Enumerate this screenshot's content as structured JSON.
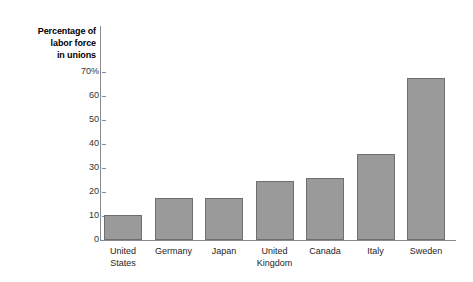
{
  "chart_data": {
    "type": "bar",
    "title": "",
    "subtitle": "",
    "xlabel": "",
    "ylabel": "Percentage of labor force in unions",
    "ylabel_lines": [
      "Percentage of",
      "labor force",
      "in unions"
    ],
    "categories": [
      "United States",
      "Germany",
      "Japan",
      "United Kingdom",
      "Canada",
      "Italy",
      "Sweden"
    ],
    "category_lines": [
      [
        "United",
        "States"
      ],
      [
        "Germany"
      ],
      [
        "Japan"
      ],
      [
        "United",
        "Kingdom"
      ],
      [
        "Canada"
      ],
      [
        "Italy"
      ],
      [
        "Sweden"
      ]
    ],
    "values": [
      10.5,
      17.5,
      17.5,
      24.5,
      26,
      36,
      67.5
    ],
    "ylim": [
      0,
      72
    ],
    "yticks": [
      0,
      10,
      20,
      30,
      40,
      50,
      60,
      70
    ],
    "ytick_labels": [
      "0",
      "10",
      "20",
      "30",
      "40",
      "50",
      "60",
      "70%"
    ],
    "grid": false,
    "legend": false,
    "legend_position": "none",
    "colors": {
      "bar_fill": "#9a9a9a",
      "bar_stroke": "#6f6f6f",
      "axis": "#8a8a8a",
      "text": "#262626",
      "background": "#ffffff"
    }
  }
}
